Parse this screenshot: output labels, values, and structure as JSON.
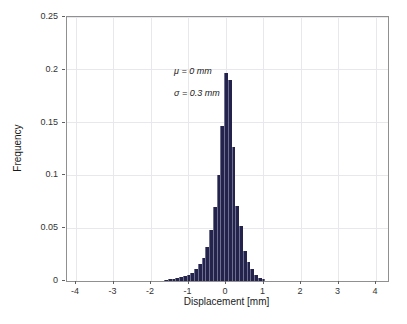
{
  "figure": {
    "background": "#ffffff"
  },
  "annotation": {
    "line1": "μ = 0 mm",
    "line2": "σ = 0.3 mm"
  },
  "colors": {
    "bar_fill": "#23234b",
    "bar_edge": "#6e6e91",
    "grid": "#e8e8ec",
    "axis_box": "#909090",
    "tick": "#606060",
    "text": "#1a1a1a"
  },
  "chart_data": {
    "type": "bar",
    "title": "",
    "xlabel": "Displacement [mm]",
    "ylabel": "Frequency",
    "xlim": [
      -4.24,
      4.32
    ],
    "ylim": [
      0,
      0.25
    ],
    "grid": true,
    "legend": null,
    "x_ticks": [
      -4,
      -3,
      -2,
      -1,
      0,
      1,
      2,
      3,
      4
    ],
    "x_tick_labels": [
      "-4",
      "-3",
      "-2",
      "-1",
      "0",
      "1",
      "2",
      "3",
      "4"
    ],
    "y_ticks": [
      0,
      0.05,
      0.1,
      0.15,
      0.2,
      0.25
    ],
    "y_tick_labels": [
      "0",
      "0.05",
      "0.1",
      "0.15",
      "0.2",
      "0.25"
    ],
    "bin_width": 0.1,
    "annotations": [
      "μ = 0 mm",
      "σ = 0.3 mm"
    ],
    "bars": [
      {
        "x": -1.6,
        "freq": 0.001
      },
      {
        "x": -1.5,
        "freq": 0.002
      },
      {
        "x": -1.4,
        "freq": 0.002
      },
      {
        "x": -1.3,
        "freq": 0.003
      },
      {
        "x": -1.2,
        "freq": 0.004
      },
      {
        "x": -1.1,
        "freq": 0.005
      },
      {
        "x": -1.0,
        "freq": 0.006
      },
      {
        "x": -0.9,
        "freq": 0.008
      },
      {
        "x": -0.8,
        "freq": 0.011
      },
      {
        "x": -0.7,
        "freq": 0.016
      },
      {
        "x": -0.6,
        "freq": 0.022
      },
      {
        "x": -0.5,
        "freq": 0.032
      },
      {
        "x": -0.4,
        "freq": 0.048
      },
      {
        "x": -0.3,
        "freq": 0.07
      },
      {
        "x": -0.2,
        "freq": 0.1
      },
      {
        "x": -0.1,
        "freq": 0.147
      },
      {
        "x": 0.0,
        "freq": 0.197
      },
      {
        "x": 0.1,
        "freq": 0.19
      },
      {
        "x": 0.2,
        "freq": 0.127
      },
      {
        "x": 0.3,
        "freq": 0.071
      },
      {
        "x": 0.4,
        "freq": 0.052
      },
      {
        "x": 0.5,
        "freq": 0.028
      },
      {
        "x": 0.6,
        "freq": 0.018
      },
      {
        "x": 0.7,
        "freq": 0.011
      },
      {
        "x": 0.8,
        "freq": 0.006
      },
      {
        "x": 0.9,
        "freq": 0.003
      },
      {
        "x": 1.0,
        "freq": 0.002
      }
    ]
  }
}
